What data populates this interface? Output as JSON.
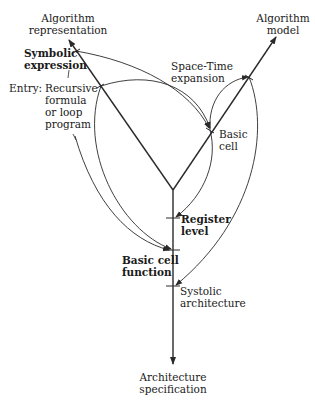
{
  "diagram": {
    "axes": {
      "top_left": {
        "line1": "Algorithm",
        "line2": "representation"
      },
      "top_right": {
        "line1": "Algorithm",
        "line2": "model"
      },
      "bottom": {
        "line1": "Architecture",
        "line2": "specification"
      }
    },
    "nodes": {
      "symbolic": {
        "line1": "Symbolic",
        "line2": "expression"
      },
      "entry": {
        "prefix": "Entry:",
        "line1": "Recursive",
        "line2": "formula",
        "line3": "or loop",
        "line4": "program"
      },
      "space_time": {
        "line1": "Space-Time",
        "line2": "expansion"
      },
      "basic_cell": {
        "line1": "Basic",
        "line2": "cell"
      },
      "register": {
        "line1": "Register",
        "line2": "level"
      },
      "basic_cell_function": {
        "line1": "Basic cell",
        "line2": "function"
      },
      "systolic": {
        "line1": "Systolic",
        "line2": "architecture"
      }
    },
    "edges": [
      {
        "from": "Symbolic expression",
        "to": "Basic cell"
      },
      {
        "from": "Entry: Recursive formula or loop program",
        "to": "Basic cell"
      },
      {
        "from": "Entry: Recursive formula or loop program",
        "to": "Basic cell function"
      },
      {
        "from": "Recursive formula or loop program",
        "to": "Basic cell function"
      },
      {
        "from": "Basic cell",
        "to": "Space-Time expansion point (algorithm model axis)"
      },
      {
        "from": "Basic cell",
        "to": "Register level"
      },
      {
        "from": "Algorithm model axis point",
        "to": "Systolic architecture"
      }
    ],
    "colors": {
      "line": "#2a2a2a",
      "background": "#ffffff"
    }
  }
}
